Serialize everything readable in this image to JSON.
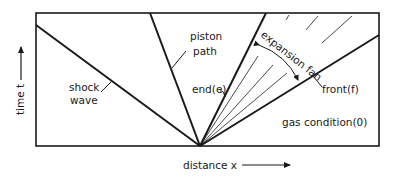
{
  "diagram": {
    "type": "x-t wave diagram",
    "axes": {
      "x_label": "distance x",
      "y_label": "time t"
    },
    "labels": {
      "shock_line1": "shock",
      "shock_line2": "wave",
      "piston_line1": "piston",
      "piston_line2": "path",
      "end": "end(e)",
      "front": "front(f)",
      "fan": "expansion fan",
      "gas": "gas condition(0)"
    },
    "colors": {
      "line": "#1a1a1a",
      "background": "#ffffff"
    }
  }
}
